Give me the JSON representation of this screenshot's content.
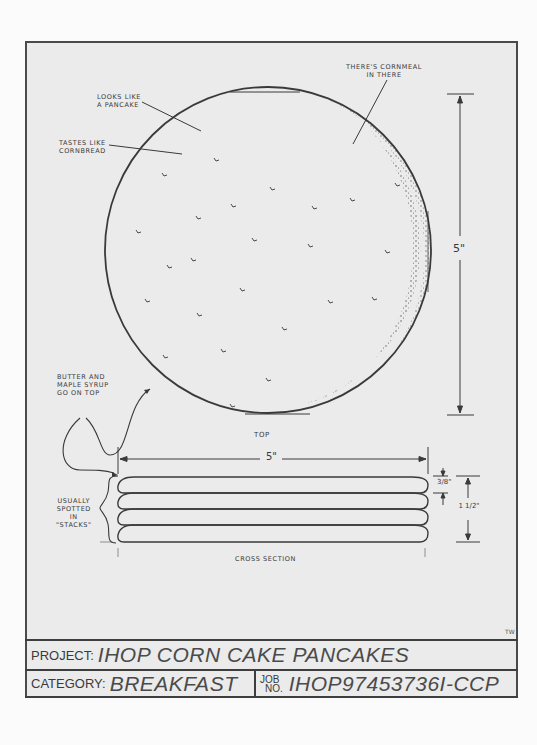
{
  "drawing": {
    "views": {
      "top": {
        "label": "TOP"
      },
      "cross_section": {
        "label": "CROSS SECTION"
      }
    },
    "annotations": {
      "looks_like": "LOOKS LIKE\nA PANCAKE",
      "tastes_like": "TASTES LIKE\nCORNBREAD",
      "cornmeal": "THERE'S CORNMEAL\nIN THERE",
      "toppings": "BUTTER AND\nMAPLE SYRUP\nGO ON TOP",
      "stacks": "USUALLY\nSPOTTED\nIN\n\"STACKS\""
    },
    "dimensions": {
      "diameter_vertical": "5\"",
      "diameter_horizontal": "5\"",
      "single_thickness": "3/8\"",
      "stack_height": "1 1/2\""
    },
    "stack_count": 4,
    "initials": "TW"
  },
  "title_block": {
    "project_label": "PROJECT:",
    "project_value": "IHOP CORN CAKE PANCAKES",
    "category_label": "CATEGORY:",
    "category_value": "BREAKFAST",
    "job_label_line1": "JOB",
    "job_label_line2": "NO.",
    "job_value": "IHOP97453736I-CCP"
  },
  "colors": {
    "paper": "#ebebeb",
    "ink": "#3a3a3a",
    "background": "#fbfbfb"
  }
}
